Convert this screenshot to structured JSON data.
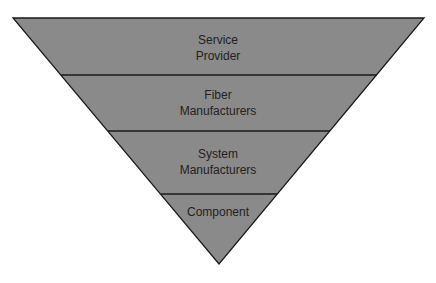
{
  "diagram": {
    "type": "inverted-pyramid",
    "fill_color": "#8a8a8a",
    "stroke_color": "#1a1a1a",
    "levels": [
      {
        "order": 1,
        "lines": [
          "Service",
          "Provider"
        ],
        "label": "Service Provider"
      },
      {
        "order": 2,
        "lines": [
          "Fiber",
          "Manufacturers"
        ],
        "label": "Fiber Manufacturers"
      },
      {
        "order": 3,
        "lines": [
          "System",
          "Manufacturers"
        ],
        "label": "System Manufacturers"
      },
      {
        "order": 4,
        "lines": [
          "Component"
        ],
        "label": "Component"
      }
    ]
  }
}
